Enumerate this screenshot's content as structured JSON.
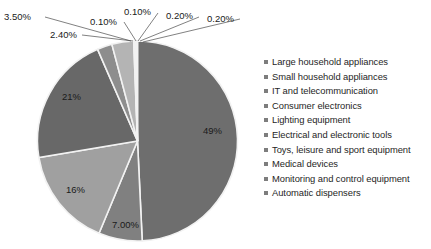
{
  "chart_data": {
    "type": "pie",
    "title": "",
    "subtitle": "",
    "xlabel": "",
    "ylabel": "",
    "grid": false,
    "legend_position": "right",
    "start_angle_deg": 0,
    "direction": "clockwise",
    "categories": [
      "Large household appliances",
      "Small household appliances",
      "IT and telecommunication",
      "Consumer electronics",
      "Lighting equipment",
      "Electrical and electronic tools",
      "Toys, leisure and sport equipment",
      "Medical devices",
      "Monitoring and control equipment",
      "Automatic dispensers"
    ],
    "values": [
      49,
      7.0,
      16,
      21,
      2.4,
      3.5,
      0.1,
      0.1,
      0.2,
      0.2
    ],
    "value_labels": [
      "49%",
      "7.00%",
      "16%",
      "21%",
      "2.40%",
      "3.50%",
      "0.10%",
      "0.10%",
      "0.20%",
      "0.20%"
    ],
    "colors": [
      "#6e6e6e",
      "#808080",
      "#a0a0a0",
      "#686868",
      "#8d8d8d",
      "#b4b4b4",
      "#9a9a9a",
      "#cfcfcf",
      "#7a7a7a",
      "#c2c2c2"
    ],
    "series": [
      {
        "name": "WEEE category share",
        "values": [
          49,
          7.0,
          16,
          21,
          2.4,
          3.5,
          0.1,
          0.1,
          0.2,
          0.2
        ]
      }
    ]
  },
  "pie": {
    "inside_labels": [
      {
        "text": "49%",
        "x": 203,
        "y": 134
      },
      {
        "text": "7.00%",
        "x": 112,
        "y": 228
      },
      {
        "text": "16%",
        "x": 66,
        "y": 193
      },
      {
        "text": "21%",
        "x": 62,
        "y": 100
      }
    ],
    "callouts": [
      {
        "text": "3.50%",
        "x": 4,
        "y": 20
      },
      {
        "text": "2.40%",
        "x": 50,
        "y": 38
      },
      {
        "text": "0.10%",
        "x": 90,
        "y": 25
      },
      {
        "text": "0.10%",
        "x": 124,
        "y": 15
      },
      {
        "text": "0.20%",
        "x": 166,
        "y": 19
      },
      {
        "text": "0.20%",
        "x": 207,
        "y": 22
      }
    ]
  },
  "legend": {
    "marker_color": "#7d7d7d",
    "items": [
      {
        "label": "Large household appliances"
      },
      {
        "label": "Small household appliances"
      },
      {
        "label": "IT and telecommunication"
      },
      {
        "label": "Consumer electronics"
      },
      {
        "label": "Lighting equipment"
      },
      {
        "label": "Electrical and electronic tools"
      },
      {
        "label": "Toys, leisure and sport equipment"
      },
      {
        "label": "Medical devices"
      },
      {
        "label": "Monitoring and control equipment"
      },
      {
        "label": "Automatic dispensers"
      }
    ]
  }
}
